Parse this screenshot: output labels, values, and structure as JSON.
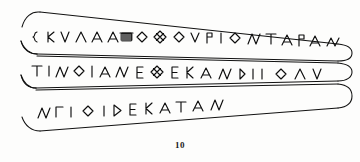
{
  "figure": {
    "caption_number": "10",
    "ink_color": "#111111",
    "background_color": "#fdfdfc"
  },
  "inscription": {
    "lines": [
      {
        "id": "line-1",
        "transcription": "ΣΚΥΛΑΑΑ▨ΟΘΟΥΡΙΟΝΤΑΡΑΝ",
        "glyphs": [
          {
            "char": "Σ",
            "type": "sigma-three-bar"
          },
          {
            "char": "Κ",
            "type": "kappa"
          },
          {
            "char": "Υ",
            "type": "upsilon"
          },
          {
            "char": "Λ",
            "type": "lambda"
          },
          {
            "char": "Λ",
            "type": "lambda"
          },
          {
            "char": "Δ",
            "type": "delta"
          },
          {
            "char": "▨",
            "type": "damaged-hatched"
          },
          {
            "char": "Ο",
            "type": "omicron-diamond"
          },
          {
            "char": "Θ",
            "type": "theta-crossed"
          },
          {
            "char": "Ο",
            "type": "omicron-diamond"
          },
          {
            "char": "Υ",
            "type": "upsilon"
          },
          {
            "char": "Ρ",
            "type": "rho"
          },
          {
            "char": "Ι",
            "type": "iota"
          },
          {
            "char": "Ο",
            "type": "omicron-diamond"
          },
          {
            "char": "Ν",
            "type": "nu"
          },
          {
            "char": "Τ",
            "type": "tau"
          },
          {
            "char": "Α",
            "type": "alpha"
          },
          {
            "char": "Ρ",
            "type": "rho"
          },
          {
            "char": "Α",
            "type": "alpha"
          },
          {
            "char": "Ν",
            "type": "nu"
          }
        ]
      },
      {
        "id": "line-2",
        "transcription": "ΤΙΝΟΙΑΝΕΘΕΚΑΝΔΙΙΟΛΥ",
        "glyphs": [
          {
            "char": "Τ",
            "type": "tau"
          },
          {
            "char": "Ι",
            "type": "iota"
          },
          {
            "char": "Ν",
            "type": "nu"
          },
          {
            "char": "Ο",
            "type": "omicron-diamond"
          },
          {
            "char": "Ι",
            "type": "iota"
          },
          {
            "char": "Α",
            "type": "alpha"
          },
          {
            "char": "Ν",
            "type": "nu"
          },
          {
            "char": "Ε",
            "type": "epsilon"
          },
          {
            "char": "Θ",
            "type": "theta-crossed"
          },
          {
            "char": "Ε",
            "type": "epsilon"
          },
          {
            "char": "Κ",
            "type": "kappa"
          },
          {
            "char": "Δ",
            "type": "delta"
          },
          {
            "char": "Ν",
            "type": "nu"
          },
          {
            "char": "Δ",
            "type": "delta-d"
          },
          {
            "char": "Ι",
            "type": "iota"
          },
          {
            "char": "Ι",
            "type": "iota"
          },
          {
            "char": "Ο",
            "type": "omicron-diamond"
          },
          {
            "char": "Λ",
            "type": "lambda"
          },
          {
            "char": "Υ",
            "type": "upsilon"
          }
        ]
      },
      {
        "id": "line-3",
        "transcription": "ΜΠΙΟΙΔΕΚΑΤΑΝ",
        "glyphs": [
          {
            "char": "Μ",
            "type": "mu"
          },
          {
            "char": "Π",
            "type": "pi-gamma"
          },
          {
            "char": "Ι",
            "type": "iota"
          },
          {
            "char": "Ο",
            "type": "omicron-diamond"
          },
          {
            "char": "Ι",
            "type": "iota"
          },
          {
            "char": "Δ",
            "type": "delta-d"
          },
          {
            "char": "Ε",
            "type": "epsilon"
          },
          {
            "char": "Κ",
            "type": "kappa"
          },
          {
            "char": "Α",
            "type": "alpha"
          },
          {
            "char": "Τ",
            "type": "tau"
          },
          {
            "char": "Α",
            "type": "alpha"
          },
          {
            "char": "Ν",
            "type": "nu"
          }
        ]
      }
    ]
  }
}
